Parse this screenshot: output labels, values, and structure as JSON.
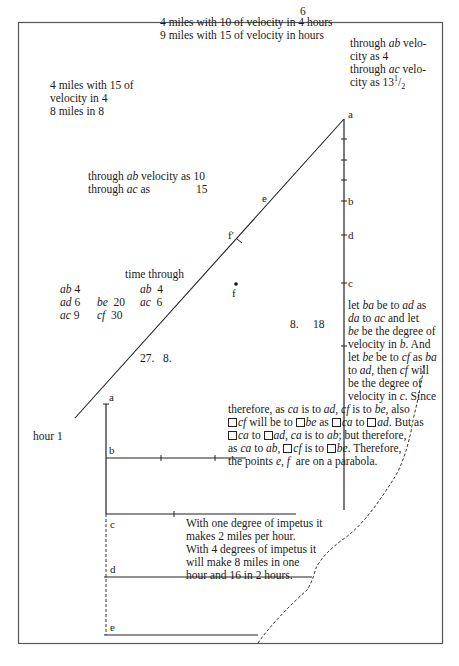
{
  "page": {
    "frame_color": "#555555",
    "ink_color": "#1a1a1a"
  },
  "notes": {
    "top_number": "6",
    "top_line1": "4 miles with 10 of velocity in 4 hours",
    "top_line2": "9 miles with 15 of velocity in hours",
    "right_top_line1_pre": "through ",
    "right_top_line1_it": "ab",
    "right_top_line1_post": " velo-",
    "right_top_line2": "city as 4",
    "right_top_line3_pre": "through ",
    "right_top_line3_it": "ac",
    "right_top_line3_post": " velo-",
    "right_top_line4_pre": "city as 13",
    "right_top_line4_sup": "1",
    "right_top_line4_frac": "/",
    "right_top_line4_sub": "2",
    "left_top_line1": "4 miles with 15 of",
    "left_top_line2": "velocity in 4",
    "left_top_line3": "8 miles in 8",
    "mid_line1_pre": "through ",
    "mid_line1_it": "ab",
    "mid_line1_post": " velocity as 10",
    "mid_line2_pre": "through ",
    "mid_line2_it": "ac",
    "mid_line2_post": " as",
    "mid_line2_num": "15",
    "time_through": "time through",
    "numbers_27": "27.   8.",
    "numbers_8_18": "8.     18",
    "hour_1": "hour 1"
  },
  "time_table": {
    "col1": [
      {
        "label": "ab",
        "value": "4"
      },
      {
        "label": "ad",
        "value": "6"
      },
      {
        "label": "ac",
        "value": "9"
      }
    ],
    "col2": [
      {
        "label": "be",
        "value": "20"
      },
      {
        "label": "cf",
        "value": "30"
      }
    ],
    "col3": [
      {
        "label": "ab",
        "value": "4"
      },
      {
        "label": "ac",
        "value": "6"
      }
    ]
  },
  "proof_text": {
    "l1": [
      "let ",
      "ba",
      " be to ",
      "ad",
      " as"
    ],
    "l2": [
      "da",
      " to ",
      "ac",
      " and let"
    ],
    "l3": [
      "be",
      " be the degree of"
    ],
    "l4": [
      "velocity in ",
      "b",
      ". And"
    ],
    "l5": [
      "let ",
      "be",
      " be to ",
      "cf",
      " as ",
      "ba"
    ],
    "l6": [
      "to ",
      "ad",
      ", then ",
      "cf",
      " will"
    ],
    "l7": [
      "be the degree of"
    ],
    "l8": [
      "velocity in ",
      "c",
      ". Since"
    ],
    "l9": [
      "therefore, as ",
      "ca",
      " is to ",
      "ad",
      ", ",
      "cf",
      " is to ",
      "be",
      ", also"
    ],
    "l10": [
      "cf",
      " will be to ",
      "be",
      " as ",
      "ca",
      " to ",
      "ad",
      ". But as"
    ],
    "l11": [
      "ca",
      " to ",
      "ad",
      ", ",
      "ca",
      " is to ",
      "ab",
      "; but therefore,"
    ],
    "l12": [
      "as ",
      "ca",
      " to ",
      "ab",
      ", ",
      "cf",
      " is to ",
      "be",
      ". Therefore,"
    ],
    "l13": [
      "the points ",
      "e",
      ", ",
      "f",
      "  are on a parabola."
    ]
  },
  "impetus_text": {
    "l1": "With one degree of impetus it",
    "l2": "makes 2 miles per hour.",
    "l3": "With 4 degrees of impetus it",
    "l4": "will make 8 miles in one",
    "l5": "hour and 16 in 2 hours."
  },
  "diagram_labels": {
    "upper_a": "a",
    "upper_b": "b",
    "upper_d": "d",
    "upper_c": "c",
    "upper_e": "e",
    "upper_f_prime": "f'",
    "upper_f": "f",
    "lower_a": "a",
    "lower_b": "b",
    "lower_c": "c",
    "lower_d": "d",
    "lower_e": "e"
  }
}
